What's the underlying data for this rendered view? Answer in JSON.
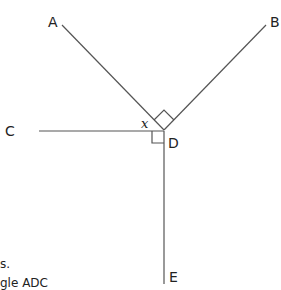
{
  "diagram": {
    "points": {
      "A": "A",
      "B": "B",
      "C": "C",
      "D": "D",
      "E": "E"
    },
    "angle_variable": "x",
    "caption_fragments": [
      "s.",
      "gle ADC"
    ],
    "line_color": "#555555"
  }
}
